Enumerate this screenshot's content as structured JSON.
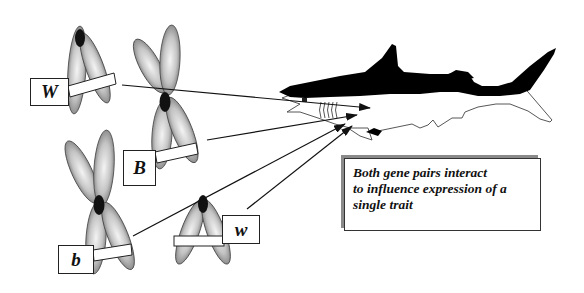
{
  "diagram": {
    "type": "genetics-illustration",
    "chromosomes": [
      {
        "id": "W",
        "label": "W",
        "form": "single-chromatid-pair (A-shape)",
        "position": "top-left"
      },
      {
        "id": "B",
        "label": "B",
        "form": "X-shaped",
        "position": "top-center"
      },
      {
        "id": "b",
        "label": "b",
        "form": "X-shaped",
        "position": "bottom-left"
      },
      {
        "id": "w",
        "label": "w",
        "form": "single-chromatid-pair (A-shape)",
        "position": "bottom-center"
      }
    ],
    "arrows": [
      {
        "from": "W",
        "to": "shark-head"
      },
      {
        "from": "B",
        "to": "shark-head"
      },
      {
        "from": "b",
        "to": "shark-head"
      },
      {
        "from": "w",
        "to": "shark-head"
      }
    ],
    "callout": {
      "lines": [
        "Both gene pairs interact",
        "to influence expression of a",
        "single trait"
      ]
    },
    "colors": {
      "shark_dark": "#000000",
      "shark_belly": "#ffffff",
      "chromosome_fill": "#b5b5b5",
      "centromere": "#111111",
      "callout_shadow": "#8a8a8a"
    }
  }
}
